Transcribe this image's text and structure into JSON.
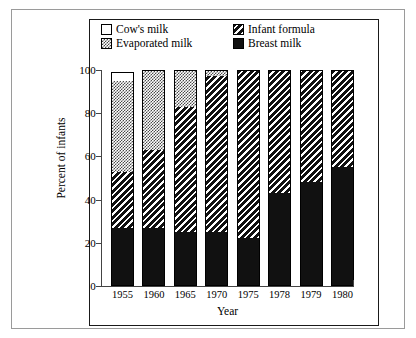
{
  "legend": {
    "items": [
      {
        "label": "Cow's milk",
        "key": "cow",
        "swatch": "white-square-swatch"
      },
      {
        "label": "Infant formula",
        "key": "formula",
        "swatch": "diagonal-hatch-swatch"
      },
      {
        "label": "Evaporated milk",
        "key": "evaporated",
        "swatch": "dotted-square-swatch"
      },
      {
        "label": "Breast milk",
        "key": "breast",
        "swatch": "solid-black-swatch"
      }
    ]
  },
  "chart_data": {
    "type": "bar",
    "stacked": true,
    "title": "",
    "xlabel": "Year",
    "ylabel": "Percent of infants",
    "ylim": [
      0,
      100
    ],
    "yticks": [
      0,
      20,
      40,
      60,
      80,
      100
    ],
    "grid": false,
    "legend_position": "top-inside",
    "categories": [
      "1955",
      "1960",
      "1965",
      "1970",
      "1975",
      "1978",
      "1979",
      "1980"
    ],
    "series": [
      {
        "name": "Breast milk",
        "key": "breast",
        "values": [
          27,
          27,
          25,
          25,
          22,
          43,
          48,
          55
        ]
      },
      {
        "name": "Infant formula",
        "key": "formula",
        "values": [
          26,
          36,
          58,
          72,
          78,
          57,
          52,
          45
        ]
      },
      {
        "name": "Evaporated milk",
        "key": "evaporated",
        "values": [
          42,
          37,
          17,
          3,
          0,
          0,
          0,
          0
        ]
      },
      {
        "name": "Cow's milk",
        "key": "cow",
        "values": [
          4,
          0,
          0,
          0,
          0,
          0,
          0,
          0
        ]
      }
    ],
    "totals": [
      99,
      100,
      100,
      100,
      100,
      100,
      100,
      100
    ]
  }
}
